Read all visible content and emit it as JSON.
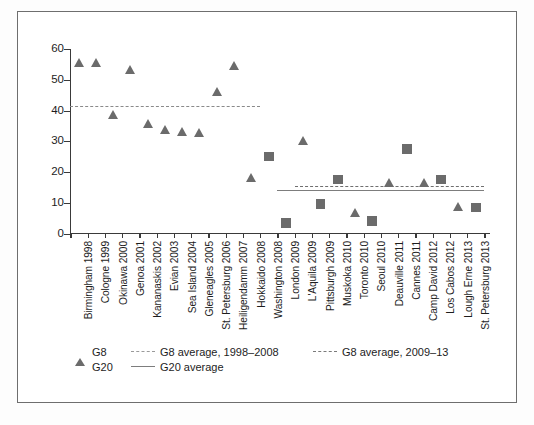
{
  "chart_data": {
    "type": "scatter",
    "title": "",
    "subtitle": "",
    "xlabel": "",
    "ylabel": "",
    "ylim": [
      0,
      60
    ],
    "yticks": [
      0,
      10,
      20,
      30,
      40,
      50,
      60
    ],
    "ytick_labels": [
      "0",
      "10",
      "20",
      "30",
      "40",
      "50",
      "60"
    ],
    "grid": false,
    "legend_position": "below-axes",
    "categories": [
      "Birmingham 1998",
      "Cologne 1999",
      "Okinawa 2000",
      "Genoa 2001",
      "Kananaskis 2002",
      "Evian 2003",
      "Sea Island 2004",
      "Gleneagles 2005",
      "St. Petersburg 2006",
      "Heiligendamm 2007",
      "Hokkaido 2008",
      "Washington 2008",
      "London 2009",
      "L'Aquila 2009",
      "Pittsburgh 2009",
      "Muskoka 2010",
      "Toronto 2010",
      "Seoul 2010",
      "Deauville 2011",
      "Cannes 2011",
      "Camp David 2012",
      "Los Cabos 2012",
      "Lough Erne 2013",
      "St. Petersburg 2013"
    ],
    "series": [
      {
        "name": "G8",
        "marker": "triangle",
        "color": "#6b6b6b",
        "values": [
          55.5,
          55.5,
          38.5,
          53.0,
          35.5,
          33.5,
          33.0,
          32.5,
          46.0,
          54.5,
          18.0,
          null,
          null,
          30.0,
          null,
          null,
          6.5,
          null,
          16.5,
          null,
          16.5,
          null,
          8.5,
          null
        ]
      },
      {
        "name": "G20",
        "marker": "square",
        "color": "#6b6b6b",
        "values": [
          null,
          null,
          null,
          null,
          null,
          null,
          null,
          null,
          null,
          null,
          null,
          25.0,
          3.5,
          null,
          9.5,
          17.5,
          null,
          4.0,
          null,
          27.5,
          null,
          17.5,
          null,
          8.5
        ]
      }
    ],
    "reference_lines": [
      {
        "name": "G8 average, 1998-2008",
        "value": 41.5,
        "style": "dashed",
        "color": "#8a8a8a",
        "x_start_category": "Birmingham 1998",
        "x_end_category": "Hokkaido 2008"
      },
      {
        "name": "G8 average, 2009-13",
        "value": 15.5,
        "style": "dashed",
        "color": "#6f6f6f",
        "x_start_category": "L'Aquila 2009",
        "x_end_category": "St. Petersburg 2013"
      },
      {
        "name": "G20 average",
        "value": 14.0,
        "style": "solid",
        "color": "#7d7d7d",
        "x_start_category": "London 2009",
        "x_end_category": "St. Petersburg 2013"
      }
    ]
  },
  "legend": {
    "entries": [
      {
        "label": "G8",
        "symbol": "triangle-marker"
      },
      {
        "label": "G8 average, 1998–2008",
        "symbol": "dashed-line-light"
      },
      {
        "label": "G8 average, 2009–13",
        "symbol": "dashed-line-dark"
      },
      {
        "label": "G20",
        "symbol": "square-marker"
      },
      {
        "label": "G20 average",
        "symbol": "solid-line"
      }
    ]
  }
}
